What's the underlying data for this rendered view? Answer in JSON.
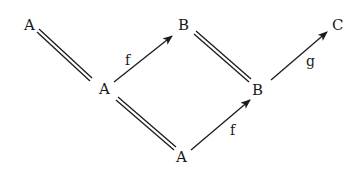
{
  "diagram": {
    "type": "commutative-diagram",
    "nodes": [
      {
        "id": "A1",
        "label": "A"
      },
      {
        "id": "A2",
        "label": "A"
      },
      {
        "id": "A3",
        "label": "A"
      },
      {
        "id": "B1",
        "label": "B"
      },
      {
        "id": "B2",
        "label": "B"
      },
      {
        "id": "C",
        "label": "C"
      }
    ],
    "edges": [
      {
        "from": "A1",
        "to": "A2",
        "kind": "equality",
        "label": ""
      },
      {
        "from": "A2",
        "to": "B1",
        "kind": "arrow",
        "label": "f"
      },
      {
        "from": "A2",
        "to": "A3",
        "kind": "equality",
        "label": ""
      },
      {
        "from": "B1",
        "to": "B2",
        "kind": "equality",
        "label": ""
      },
      {
        "from": "A3",
        "to": "B2",
        "kind": "arrow",
        "label": "f"
      },
      {
        "from": "B2",
        "to": "C",
        "kind": "arrow",
        "label": "g"
      }
    ],
    "colors": {
      "ink": "#1a1a1a",
      "background": "#ffffff"
    }
  }
}
